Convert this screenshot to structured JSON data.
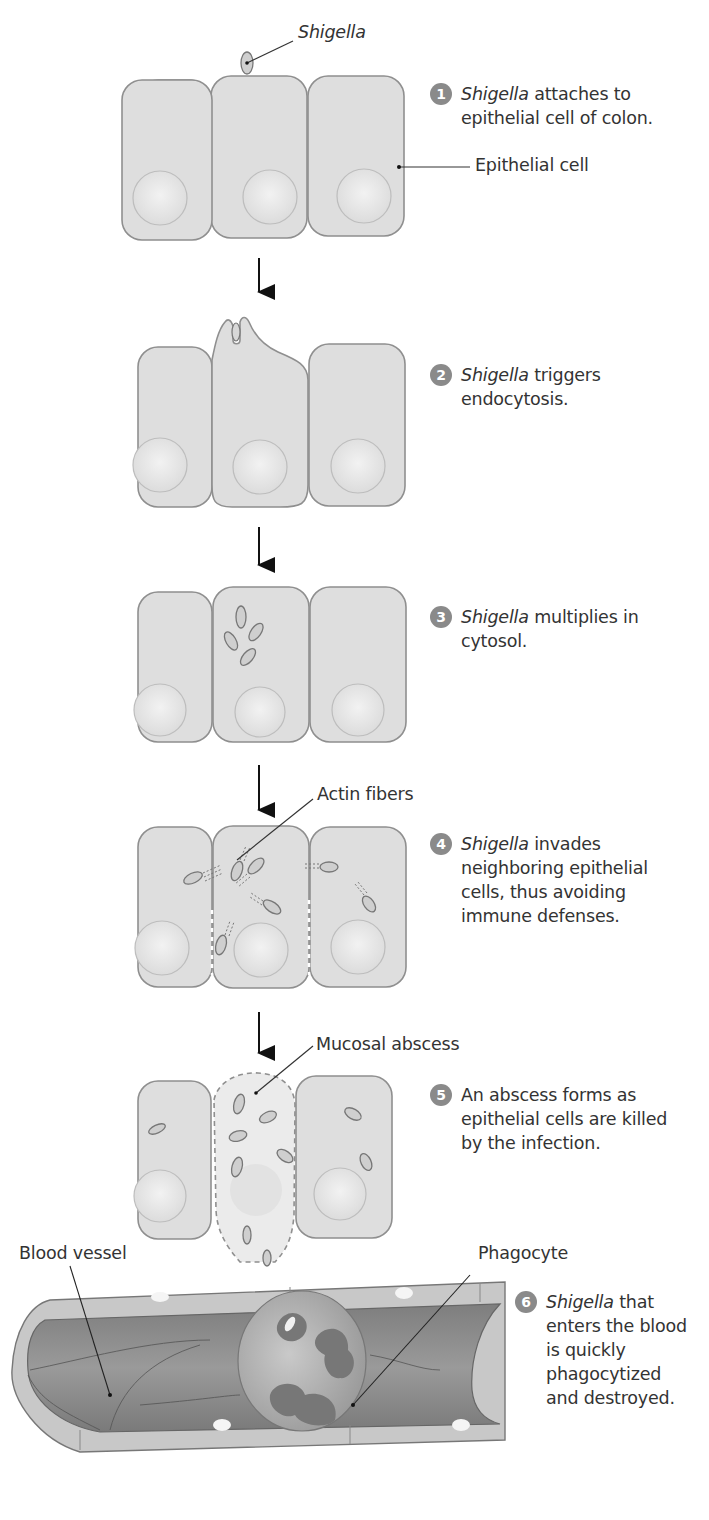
{
  "diagram": {
    "colors": {
      "cell_fill": "#dedede",
      "cell_stroke": "#8f8f8f",
      "nucleus_fill": "#e8e8e8",
      "badge": "#8a8a8a",
      "vessel_lumen": "#8d8d8d",
      "vessel_wall": "#c8c8c8",
      "phagocyte": "#a9a9a9",
      "text": "#333333"
    },
    "labels": {
      "shigella": "Shigella",
      "epithelial_cell": "Epithelial cell",
      "actin_fibers": "Actin fibers",
      "mucosal_abscess": "Mucosal abscess",
      "blood_vessel": "Blood vessel",
      "phagocyte": "Phagocyte"
    },
    "steps": [
      {
        "number": "1",
        "italic": "Shigella",
        "text": " attaches to epithelial cell of colon."
      },
      {
        "number": "2",
        "italic": "Shigella",
        "text": " triggers endocytosis."
      },
      {
        "number": "3",
        "italic": "Shigella",
        "text": " multiplies in cytosol."
      },
      {
        "number": "4",
        "italic": "Shigella",
        "text": " invades neighboring epithelial cells, thus avoiding immune defenses."
      },
      {
        "number": "5",
        "italic": "",
        "text": "An abscess forms as epithelial cells are killed by the infection."
      },
      {
        "number": "6",
        "italic": "Shigella",
        "text": " that enters the blood is quickly phagocytized and destroyed."
      }
    ]
  }
}
